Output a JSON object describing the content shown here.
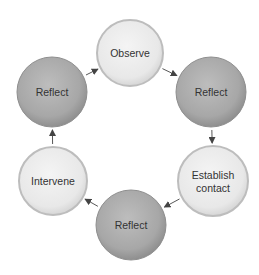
{
  "diagram": {
    "type": "cycle",
    "colors": {
      "light_fill": "#ececec",
      "light_edge": "#bdbdbd",
      "dark_fill": "#a9a9a9",
      "dark_edge": "#8e8e8e",
      "text": "#333333",
      "arrow": "#444444"
    },
    "nodes": [
      {
        "id": "observe",
        "label_lines": [
          "Observe"
        ],
        "style": "light",
        "cx": 130,
        "cy": 53,
        "r": 33
      },
      {
        "id": "reflect-right",
        "label_lines": [
          "Reflect"
        ],
        "style": "dark",
        "cx": 211,
        "cy": 92,
        "r": 35
      },
      {
        "id": "establish-contact",
        "label_lines": [
          "Establish",
          "contact"
        ],
        "style": "light",
        "cx": 213,
        "cy": 181,
        "r": 35
      },
      {
        "id": "reflect-bottom",
        "label_lines": [
          "Reflect"
        ],
        "style": "dark",
        "cx": 131,
        "cy": 225,
        "r": 35
      },
      {
        "id": "intervene",
        "label_lines": [
          "Intervene"
        ],
        "style": "light",
        "cx": 53,
        "cy": 181,
        "r": 34
      },
      {
        "id": "reflect-left",
        "label_lines": [
          "Reflect"
        ],
        "style": "dark",
        "cx": 52,
        "cy": 92,
        "r": 35
      }
    ],
    "edges": [
      {
        "from": "observe",
        "to": "reflect-right"
      },
      {
        "from": "reflect-right",
        "to": "establish-contact"
      },
      {
        "from": "establish-contact",
        "to": "reflect-bottom"
      },
      {
        "from": "reflect-bottom",
        "to": "intervene"
      },
      {
        "from": "intervene",
        "to": "reflect-left"
      },
      {
        "from": "reflect-left",
        "to": "observe"
      }
    ]
  }
}
